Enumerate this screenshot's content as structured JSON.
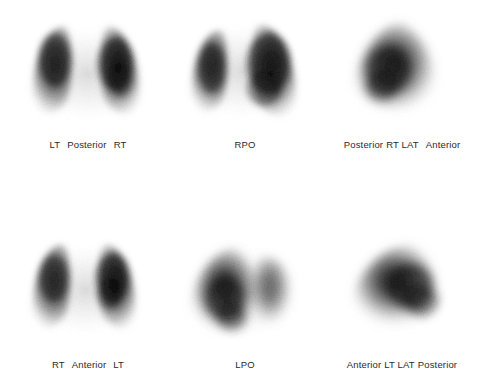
{
  "study": {
    "background_color": "#ffffff",
    "text_color": "#2b2b2b",
    "modality": "lung-perfusion-scintigraphy",
    "panel_count": 6,
    "rows": 2,
    "columns": 3
  },
  "panels": [
    {
      "id": "panel-posterior",
      "view": "Posterior",
      "label_full": "LT   Posterior   RT",
      "label_left": "LT",
      "label_center": "Posterior",
      "label_right": "RT",
      "shape": "two-lungs-symmetric",
      "row": 0,
      "column": 0
    },
    {
      "id": "panel-rpo",
      "view": "RPO",
      "label_full": "RPO",
      "label_left": "",
      "label_center": "RPO",
      "label_right": "",
      "shape": "two-lungs-oblique-right",
      "row": 0,
      "column": 1
    },
    {
      "id": "panel-rt-lat",
      "view": "RT LAT",
      "label_full": "Posterior  RT LAT   Anterior",
      "label_left": "Posterior",
      "label_center": "RT LAT",
      "label_right": "Anterior",
      "shape": "single-lung-lateral",
      "row": 0,
      "column": 2
    },
    {
      "id": "panel-anterior",
      "view": "Anterior",
      "label_full": "RT   Anterior   LT",
      "label_left": "RT",
      "label_center": "Anterior",
      "label_right": "LT",
      "shape": "two-lungs-symmetric",
      "row": 1,
      "column": 0
    },
    {
      "id": "panel-lpo",
      "view": "LPO",
      "label_full": "LPO",
      "label_left": "",
      "label_center": "LPO",
      "label_right": "",
      "shape": "two-lungs-oblique-left",
      "row": 1,
      "column": 1
    },
    {
      "id": "panel-lt-lat",
      "view": "LT LAT",
      "label_full": "Anterior  LT  LAT  Posterior",
      "label_left": "Anterior",
      "label_center": "LT LAT",
      "label_right": "Posterior",
      "shape": "single-lung-lateral",
      "row": 1,
      "column": 2
    }
  ]
}
